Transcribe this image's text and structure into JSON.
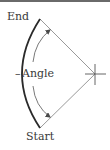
{
  "diagram": {
    "labels": {
      "end": "End",
      "angle": "Angle",
      "start": "Start"
    },
    "colors": {
      "outer_arc": "#2a2a2a",
      "radius_lines": "#9a9a9a",
      "angle_arrow": "#4a4a4a",
      "crosshair": "#555555",
      "border": "#6a6a6a",
      "text": "#3a3a3a"
    },
    "geometry": {
      "center": [
        95,
        74
      ],
      "end_point": [
        40,
        19
      ],
      "start_point": [
        40,
        128
      ]
    }
  }
}
